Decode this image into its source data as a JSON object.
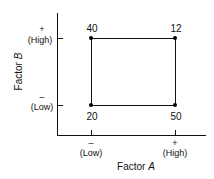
{
  "diagram": {
    "x_axis": {
      "title": "Factor",
      "var": "A",
      "low_sign": "–",
      "low_label": "(Low)",
      "high_sign": "+",
      "high_label": "(High)"
    },
    "y_axis": {
      "title": "Factor",
      "var": "B",
      "low_sign": "–",
      "low_label": "(Low)",
      "high_sign": "+",
      "high_label": "(High)"
    },
    "corners": {
      "low_low": "20",
      "high_low": "50",
      "low_high": "40",
      "high_high": "12"
    }
  }
}
